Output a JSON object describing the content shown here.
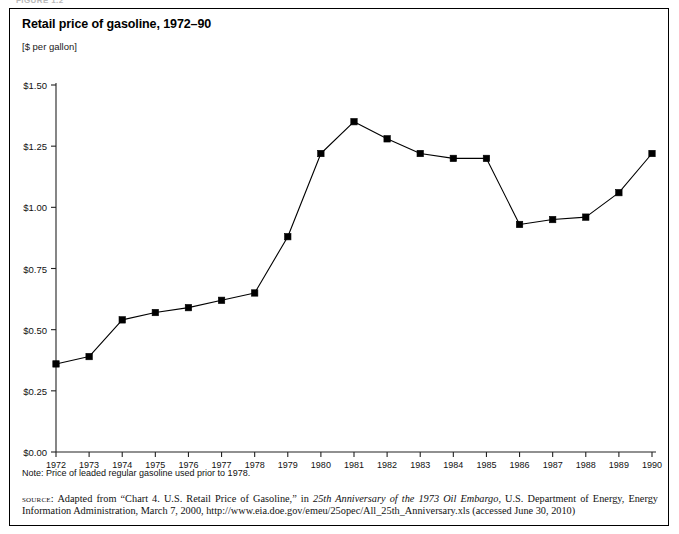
{
  "figure_tag": "FIGURE 1.2",
  "figure": {
    "title": "Retail price of gasoline, 1972–90",
    "unit_label": "[$ per gallon]",
    "note": "Note: Price of leaded regular gasoline used prior to 1978.",
    "source_prefix": "source:",
    "source_part1": " Adapted from “Chart 4. U.S. Retail Price of Gasoline,” in ",
    "source_italic": "25th Anniversary of the 1973 Oil Embargo",
    "source_part2": ", U.S. Department of Energy, Energy Information Administration, March 7, 2000, http://www.eia.doe.gov/emeu/25opec/All_25th_Anniversary.xls (accessed June 30, 2010)"
  },
  "chart_data": {
    "type": "line",
    "title": "Retail price of gasoline, 1972–90",
    "xlabel": "",
    "ylabel": "[$ per gallon]",
    "ylim": [
      0,
      1.5
    ],
    "yticks": [
      0,
      0.25,
      0.5,
      0.75,
      1.0,
      1.25,
      1.5
    ],
    "ytick_labels": [
      "$0.00",
      "$0.25",
      "$0.50",
      "$0.75",
      "$1.00",
      "$1.25",
      "$1.50"
    ],
    "grid": false,
    "legend": "none",
    "marker": "square",
    "line_color": "#000000",
    "marker_color": "#000000",
    "categories": [
      1972,
      1973,
      1974,
      1975,
      1976,
      1977,
      1978,
      1979,
      1980,
      1981,
      1982,
      1983,
      1984,
      1985,
      1986,
      1987,
      1988,
      1989,
      1990
    ],
    "xtick_labels": [
      "1972",
      "1973",
      "1974",
      "1975",
      "1976",
      "1977",
      "1978",
      "1979",
      "1980",
      "1981",
      "1982",
      "1983",
      "1984",
      "1985",
      "1986",
      "1987",
      "1988",
      "1989",
      "1990"
    ],
    "values": [
      0.36,
      0.39,
      0.54,
      0.57,
      0.59,
      0.62,
      0.65,
      0.88,
      1.22,
      1.35,
      1.28,
      1.22,
      1.2,
      1.2,
      0.93,
      0.95,
      0.96,
      1.06,
      1.22
    ],
    "series": [
      {
        "name": "Retail price of gasoline ($ per gallon)",
        "values": [
          0.36,
          0.39,
          0.54,
          0.57,
          0.59,
          0.62,
          0.65,
          0.88,
          1.22,
          1.35,
          1.28,
          1.22,
          1.2,
          1.2,
          0.93,
          0.95,
          0.96,
          1.06,
          1.22
        ]
      }
    ],
    "annotations": [
      "Note: Price of leaded regular gasoline used prior to 1978."
    ]
  }
}
